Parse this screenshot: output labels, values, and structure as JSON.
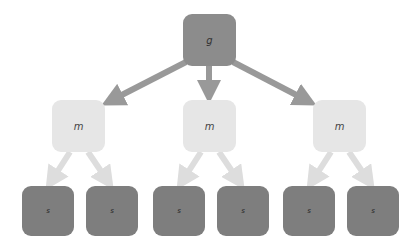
{
  "diagram": {
    "type": "tree",
    "colors": {
      "root": "#8c8c8c",
      "middle": "#e6e6e6",
      "leaf": "#7e7e7e",
      "root_arrow": "#999999",
      "middle_arrow": "#dddddd"
    },
    "root": {
      "label": "g"
    },
    "middle": [
      {
        "label": "m"
      },
      {
        "label": "m"
      },
      {
        "label": "m"
      }
    ],
    "leaves": [
      {
        "label": "s"
      },
      {
        "label": "s"
      },
      {
        "label": "s"
      },
      {
        "label": "s"
      },
      {
        "label": "s"
      },
      {
        "label": "s"
      }
    ]
  }
}
